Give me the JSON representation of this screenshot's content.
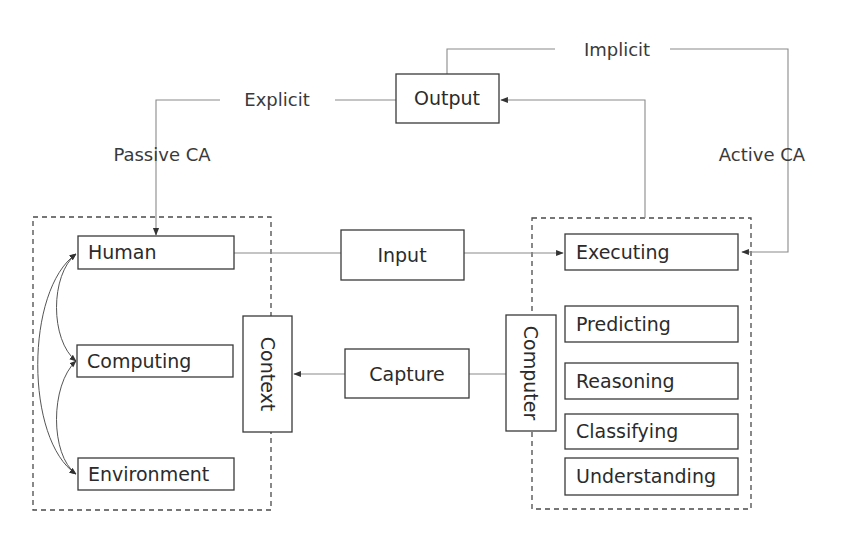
{
  "diagram": {
    "type": "flow-diagram",
    "groups": {
      "context": {
        "label": "Context"
      },
      "computer": {
        "label": "Computer"
      }
    },
    "nodes": {
      "output": "Output",
      "input": "Input",
      "capture": "Capture",
      "human": "Human",
      "computing": "Computing",
      "environment": "Environment",
      "executing": "Executing",
      "predicting": "Predicting",
      "reasoning": "Reasoning",
      "classifying": "Classifying",
      "understanding": "Understanding"
    },
    "edge_labels": {
      "implicit": "Implicit",
      "explicit": "Explicit",
      "passive_ca": "Passive CA",
      "active_ca": "Active CA"
    },
    "edges": [
      {
        "from": "Human",
        "to": "Executing",
        "via": "Input"
      },
      {
        "from": "Computer",
        "to": "Context",
        "via": "Capture"
      },
      {
        "from": "Executing",
        "to": "Output"
      },
      {
        "from": "Output",
        "to": "Human",
        "label": "Explicit / Passive CA"
      },
      {
        "from": "Output",
        "to": "Executing",
        "label": "Implicit / Active CA"
      },
      {
        "from": "Human",
        "to": "Computing",
        "bidirectional": true
      },
      {
        "from": "Computing",
        "to": "Environment",
        "bidirectional": true
      },
      {
        "from": "Human",
        "to": "Environment",
        "bidirectional": true
      }
    ]
  }
}
